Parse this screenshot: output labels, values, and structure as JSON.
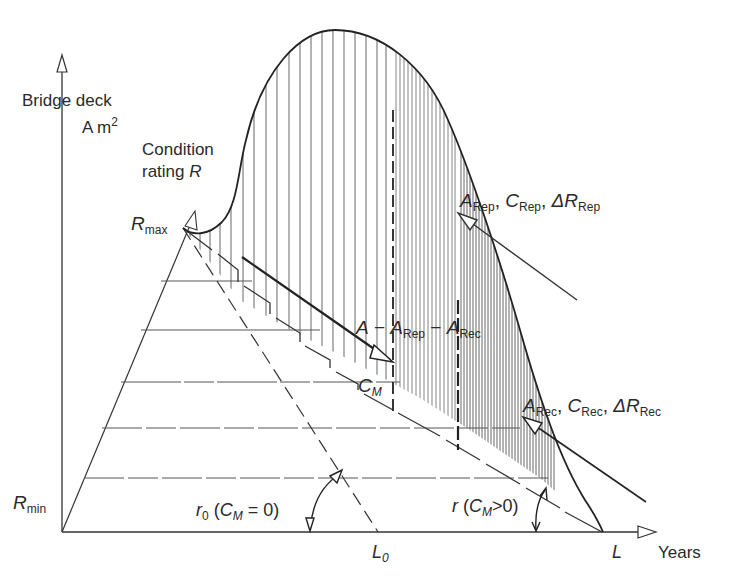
{
  "diagram": {
    "type": "bridge deck deterioration / maintenance area diagram",
    "axes": {
      "vertical": {
        "label_line1": "Bridge deck",
        "label_line2_main": "A m",
        "label_line2_sup": "2"
      },
      "condition": {
        "label_line1": "Condition",
        "label_line2_text": "rating ",
        "label_line2_var": "R"
      },
      "horizontal": {
        "label": "Years"
      }
    },
    "markers": {
      "r_max": {
        "main": "R",
        "sub": "max"
      },
      "r_min": {
        "main": "R",
        "sub": "min"
      },
      "L0": {
        "main": "L",
        "sub": "0"
      },
      "L": {
        "main": "L"
      }
    },
    "annotations": {
      "rep": {
        "a_main": "A",
        "a_sub": "Rep",
        "sep1": ", ",
        "c_main": "C",
        "c_sub": "Rep",
        "sep2": ", ",
        "dr_main": "ΔR",
        "dr_sub": "Rep"
      },
      "rec": {
        "a_main": "A",
        "a_sub": "Rec",
        "sep1": ", ",
        "c_main": "C",
        "c_sub": "Rec",
        "sep2": ", ",
        "dr_main": "ΔR",
        "dr_sub": "Rec"
      },
      "remaining_area": {
        "a": "A",
        "minus1": " − ",
        "a_rep_main": "A",
        "a_rep_sub": "Rep",
        "minus2": " − ",
        "a_rec_main": "A",
        "a_rec_sub": "Rec"
      },
      "cm": {
        "main": "C",
        "sub": "M"
      },
      "r0": {
        "main": "r",
        "sub": "0",
        "open": " (",
        "c": "C",
        "c_sub": "M",
        "rest": " = 0)"
      },
      "r": {
        "main": "r",
        "open": " (",
        "c": "C",
        "c_sub": "M",
        "rest": ">0)"
      }
    },
    "colors": {
      "line": "#2a2a2a",
      "hatch": "#555555",
      "background": "#ffffff"
    }
  }
}
